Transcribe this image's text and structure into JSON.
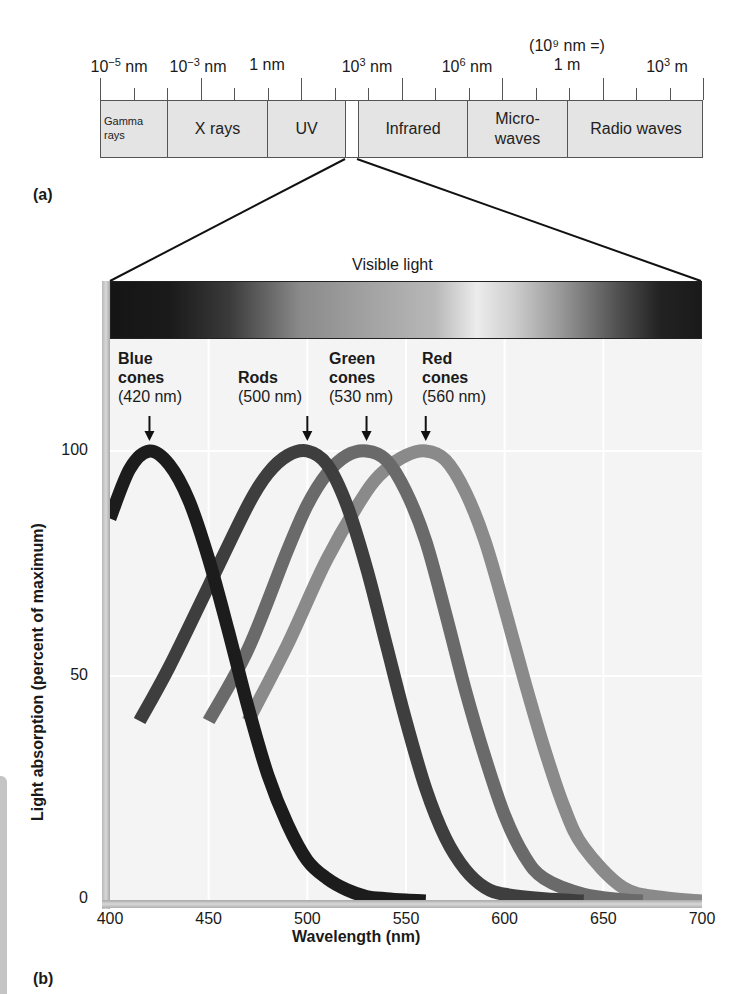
{
  "panel_a": {
    "label": "(a)",
    "scale_note": "(10⁹ nm =)",
    "scale_labels": [
      {
        "base": "10",
        "exp": "−5",
        "unit": " nm",
        "x": 119
      },
      {
        "base": "10",
        "exp": "−3",
        "unit": " nm",
        "x": 198
      },
      {
        "base": "",
        "exp": "",
        "unit": "1 nm",
        "x": 267
      },
      {
        "base": "10",
        "exp": "3",
        "unit": " nm",
        "x": 367
      },
      {
        "base": "10",
        "exp": "6",
        "unit": " nm",
        "x": 467
      },
      {
        "base": "",
        "exp": "",
        "unit": "1 m",
        "x": 567
      },
      {
        "base": "10",
        "exp": "3",
        "unit": " m",
        "x": 667
      }
    ],
    "bands": [
      {
        "name": "Gamma rays",
        "line1": "Gamma",
        "line2": "rays",
        "left": 0,
        "width": 67,
        "style": "small"
      },
      {
        "name": "X rays",
        "line1": "X rays",
        "line2": "",
        "left": 67,
        "width": 100,
        "style": ""
      },
      {
        "name": "UV",
        "line1": "UV",
        "line2": "",
        "left": 167,
        "width": 78,
        "style": ""
      },
      {
        "name": "Visible",
        "line1": "",
        "line2": "",
        "left": 245,
        "width": 13,
        "style": "gap"
      },
      {
        "name": "Infrared",
        "line1": "Infrared",
        "line2": "",
        "left": 258,
        "width": 109,
        "style": ""
      },
      {
        "name": "Microwaves",
        "line1": "Micro-",
        "line2": "waves",
        "left": 367,
        "width": 100,
        "style": ""
      },
      {
        "name": "Radio waves",
        "line1": "Radio waves",
        "line2": "",
        "left": 467,
        "width": 136,
        "style": "last"
      }
    ]
  },
  "panel_b": {
    "label": "(b)",
    "visible_bar_label": "Visible light"
  },
  "chart_data": {
    "type": "line",
    "title": "Visible light",
    "xlabel": "Wavelength (nm)",
    "ylabel": "Light absorption (percent of maximum)",
    "xlim": [
      400,
      700
    ],
    "ylim": [
      0,
      100
    ],
    "xticks": [
      400,
      450,
      500,
      550,
      600,
      650,
      700
    ],
    "yticks": [
      0,
      50,
      100
    ],
    "grid": true,
    "legend": "inline annotations with arrows at peaks",
    "series": [
      {
        "name": "Blue cones",
        "peak_label": "(420 nm)",
        "peak_nm": 420,
        "color": "#1c1c1c",
        "x": [
          400,
          410,
          420,
          430,
          440,
          450,
          460,
          470,
          480,
          490,
          500,
          510,
          520,
          530,
          540,
          550,
          560
        ],
        "y": [
          85,
          96,
          100,
          97,
          89,
          76,
          60,
          43,
          28,
          17,
          9,
          5,
          2.5,
          1,
          0.5,
          0.2,
          0
        ]
      },
      {
        "name": "Rods",
        "peak_label": "(500 nm)",
        "peak_nm": 500,
        "color": "#3e3e3e",
        "x": [
          415,
          430,
          450,
          470,
          480,
          490,
          500,
          510,
          520,
          530,
          540,
          550,
          560,
          570,
          580,
          590,
          600,
          620,
          640
        ],
        "y": [
          40,
          52,
          70,
          88,
          95,
          99,
          100,
          97,
          88,
          74,
          57,
          40,
          25,
          14,
          7,
          3,
          1.5,
          0.5,
          0
        ]
      },
      {
        "name": "Green cones",
        "peak_label": "(530 nm)",
        "peak_nm": 530,
        "color": "#6a6a6a",
        "x": [
          450,
          470,
          490,
          500,
          510,
          520,
          530,
          540,
          550,
          560,
          570,
          580,
          590,
          600,
          610,
          620,
          640,
          660,
          670
        ],
        "y": [
          40,
          56,
          78,
          88,
          95,
          99,
          100,
          98,
          91,
          80,
          64,
          47,
          32,
          19,
          10,
          5,
          1.5,
          0.3,
          0
        ]
      },
      {
        "name": "Red cones",
        "peak_label": "(560 nm)",
        "peak_nm": 560,
        "color": "#8a8a8a",
        "x": [
          470,
          490,
          510,
          530,
          540,
          550,
          560,
          570,
          580,
          590,
          600,
          610,
          620,
          630,
          640,
          660,
          680,
          700
        ],
        "y": [
          40,
          57,
          76,
          91,
          96,
          99,
          100,
          98,
          91,
          80,
          65,
          49,
          34,
          21,
          12,
          3,
          0.8,
          0
        ]
      }
    ]
  },
  "cone_labels": [
    {
      "title1": "Blue",
      "title2": "cones",
      "nm": "(420 nm)",
      "left": 118,
      "top": 349
    },
    {
      "title1": "",
      "title2": "Rods",
      "nm": "(500 nm)",
      "left": 238,
      "top": 349
    },
    {
      "title1": "Green",
      "title2": "cones",
      "nm": "(530 nm)",
      "left": 329,
      "top": 349
    },
    {
      "title1": "Red",
      "title2": "cones",
      "nm": "(560 nm)",
      "left": 422,
      "top": 349
    }
  ],
  "axis": {
    "x_title": "Wavelength (nm)",
    "y_title": "Light absorption (percent of maximum)",
    "x_ticks": [
      "400",
      "450",
      "500",
      "550",
      "600",
      "650",
      "700"
    ],
    "y_ticks": [
      "100",
      "50",
      "0"
    ]
  }
}
